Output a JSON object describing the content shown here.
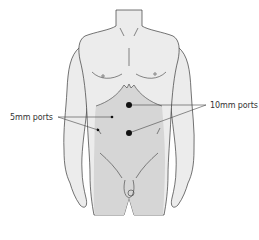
{
  "figure": {
    "colors": {
      "skin": "#ececec",
      "abdomen_shaded": "#d6d6d6",
      "outline": "#3a3a3a",
      "port": "#111111",
      "leader": "#444444"
    }
  },
  "labels": {
    "five_mm": "5mm ports",
    "ten_mm": "10mm ports"
  },
  "ports": [
    {
      "size": "10mm",
      "x": 129,
      "y": 105,
      "r": 3
    },
    {
      "size": "10mm",
      "x": 129,
      "y": 133,
      "r": 3
    },
    {
      "size": "5mm",
      "x": 112,
      "y": 117,
      "r": 1.3
    },
    {
      "size": "5mm",
      "x": 98,
      "y": 130,
      "r": 1.3
    }
  ]
}
